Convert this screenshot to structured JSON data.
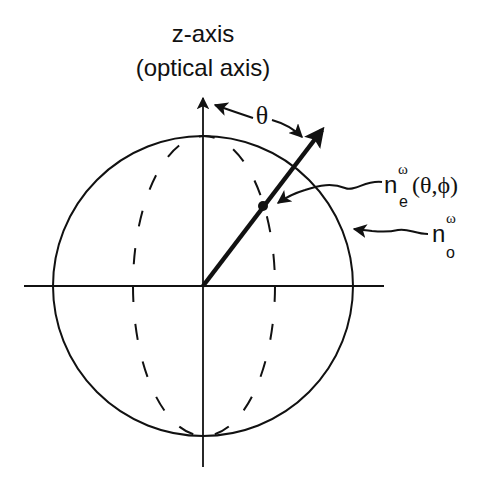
{
  "title_line1": "z-axis",
  "title_line2": "(optical axis)",
  "theta_label": "θ",
  "ne_label": {
    "base": "n",
    "superscript": "ω",
    "subscript": "e",
    "args": "(θ,ϕ)"
  },
  "no_label": {
    "base": "n",
    "superscript": "ω",
    "subscript": "o"
  },
  "geometry": {
    "center": [
      203,
      286
    ],
    "circle_radius": 150,
    "ellipse_rx": 71,
    "ellipse_ry": 150,
    "vector_tip": [
      322,
      130
    ],
    "dot": [
      263,
      206
    ]
  },
  "colors": {
    "stroke": "#111111",
    "background": "#ffffff"
  }
}
